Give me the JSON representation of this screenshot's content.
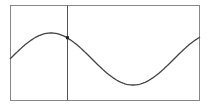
{
  "chart_data": {
    "type": "line",
    "title": "",
    "xlabel": "",
    "ylabel": "",
    "series": [
      {
        "name": "sine",
        "function": "y = sin(x)",
        "x_range_periods": [
          0,
          1.16
        ],
        "points_px": [
          [
            10,
            59
          ],
          [
            30,
            41
          ],
          [
            51,
            33
          ],
          [
            67,
            38
          ],
          [
            92,
            59
          ],
          [
            112,
            77
          ],
          [
            133,
            85
          ],
          [
            154,
            77
          ],
          [
            174,
            59
          ],
          [
            190,
            43
          ],
          [
            200,
            37
          ]
        ]
      }
    ],
    "cursor": {
      "x_px": 67,
      "y_px": 38,
      "phase_fraction": 0.35
    },
    "plot_box_px": {
      "x0": 10,
      "y0": 5,
      "x1": 200,
      "y1": 101
    },
    "grid": false,
    "legend": null,
    "colors": {
      "frame": "#888888",
      "curve": "#444444",
      "cursor": "#555555",
      "marker": "#222222",
      "background": "#ffffff"
    }
  }
}
